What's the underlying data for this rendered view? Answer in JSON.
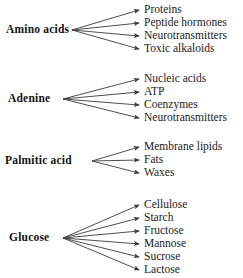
{
  "diagram": {
    "type": "fan-out-branching-diagram",
    "title": "",
    "background_color": "#ffffff",
    "text_color": "#1a1a1a",
    "arrow_color": "#3a3a3a",
    "groups": [
      {
        "id": "amino-acids",
        "source": "Amino acids",
        "source_x": 6,
        "source_y": 30,
        "origin_x": 72,
        "origin_y": 30,
        "tip_x": 139,
        "label_x": 144,
        "products": [
          {
            "label": "Proteins",
            "y": 10
          },
          {
            "label": "Peptide hormones",
            "y": 23
          },
          {
            "label": "Neurotransmitters",
            "y": 36
          },
          {
            "label": "Toxic alkaloids",
            "y": 49
          }
        ]
      },
      {
        "id": "adenine",
        "source": "Adenine",
        "source_x": 8,
        "source_y": 99,
        "origin_x": 63,
        "origin_y": 99,
        "tip_x": 139,
        "label_x": 144,
        "products": [
          {
            "label": "Nucleic acids",
            "y": 79
          },
          {
            "label": "ATP",
            "y": 92
          },
          {
            "label": "Coenzymes",
            "y": 105
          },
          {
            "label": "Neurotransmitters",
            "y": 118
          }
        ]
      },
      {
        "id": "palmitic-acid",
        "source": "Palmitic acid",
        "source_x": 5,
        "source_y": 161,
        "origin_x": 92,
        "origin_y": 161,
        "tip_x": 139,
        "label_x": 144,
        "products": [
          {
            "label": "Membrane lipids",
            "y": 147
          },
          {
            "label": "Fats",
            "y": 160
          },
          {
            "label": "Waxes",
            "y": 173
          }
        ]
      },
      {
        "id": "glucose",
        "source": "Glucose",
        "source_x": 9,
        "source_y": 238,
        "origin_x": 63,
        "origin_y": 238,
        "tip_x": 139,
        "label_x": 144,
        "products": [
          {
            "label": "Cellulose",
            "y": 205
          },
          {
            "label": "Starch",
            "y": 218
          },
          {
            "label": "Fructose",
            "y": 231
          },
          {
            "label": "Mannose",
            "y": 244
          },
          {
            "label": "Sucrose",
            "y": 257
          },
          {
            "label": "Lactose",
            "y": 270
          }
        ]
      }
    ]
  }
}
